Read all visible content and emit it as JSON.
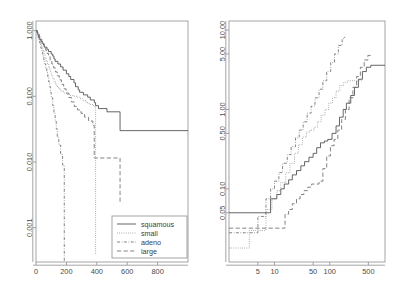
{
  "figure": {
    "title": "",
    "panel_count": 2
  },
  "legend": {
    "position": "bottom-right of left panel",
    "entries": [
      {
        "label": "squamous",
        "style": "solid",
        "color": "#4a4a4a"
      },
      {
        "label": "small",
        "style": "dotted",
        "color": "#6e6e6e"
      },
      {
        "label": "adeno",
        "style": "dashdot",
        "color": "#6e6e6e"
      },
      {
        "label": "large",
        "style": "dashed",
        "color": "#6e6e6e"
      }
    ]
  },
  "chart_data": [
    {
      "id": "left-panel",
      "type": "line",
      "title": "",
      "xlabel": "",
      "ylabel": "",
      "xscale": "linear",
      "yscale": "log",
      "xlim": [
        0,
        1000
      ],
      "ylim": [
        0.0003,
        1.4
      ],
      "grid": false,
      "legend_position": "lower right",
      "xticks": [
        0,
        200,
        400,
        600,
        800
      ],
      "xtick_labels": [
        "0",
        "200",
        "400",
        "600",
        "800"
      ],
      "yticks": [
        1.0,
        0.1,
        0.01,
        0.001
      ],
      "ytick_labels": [
        "1.000",
        "0.100",
        "0.010",
        "0.001"
      ],
      "series": [
        {
          "name": "squamous",
          "style": "solid",
          "x": [
            1,
            8,
            11,
            15,
            21,
            25,
            33,
            42,
            51,
            54,
            72,
            82,
            100,
            110,
            118,
            126,
            144,
            162,
            178,
            200,
            216,
            228,
            250,
            260,
            278,
            287,
            312,
            340,
            357,
            384,
            392,
            411,
            467,
            553,
            587,
            1000
          ],
          "y": [
            1.0,
            0.94,
            0.88,
            0.82,
            0.77,
            0.73,
            0.68,
            0.64,
            0.6,
            0.56,
            0.52,
            0.48,
            0.44,
            0.41,
            0.37,
            0.34,
            0.31,
            0.28,
            0.25,
            0.22,
            0.2,
            0.18,
            0.16,
            0.14,
            0.125,
            0.115,
            0.105,
            0.097,
            0.088,
            0.08,
            0.072,
            0.065,
            0.058,
            0.03,
            0.03,
            0.03
          ]
        },
        {
          "name": "small",
          "style": "dotted",
          "x": [
            1,
            7,
            13,
            18,
            24,
            29,
            35,
            40,
            47,
            53,
            59,
            67,
            75,
            84,
            92,
            100,
            110,
            119,
            130,
            141,
            156,
            170,
            185,
            200,
            220,
            245,
            270,
            290,
            310,
            330,
            350,
            378,
            392
          ],
          "y": [
            1.0,
            0.93,
            0.86,
            0.79,
            0.72,
            0.66,
            0.6,
            0.54,
            0.49,
            0.44,
            0.39,
            0.35,
            0.31,
            0.27,
            0.24,
            0.21,
            0.185,
            0.165,
            0.148,
            0.135,
            0.125,
            0.118,
            0.112,
            0.107,
            0.103,
            0.1,
            0.097,
            0.092,
            0.086,
            0.08,
            0.075,
            0.07,
            0.0004
          ]
        },
        {
          "name": "adeno",
          "style": "dashdot",
          "x": [
            1,
            6,
            10,
            15,
            20,
            26,
            32,
            38,
            44,
            51,
            58,
            64,
            71,
            78,
            84,
            90,
            95,
            100,
            110,
            118,
            126,
            133,
            140,
            150,
            162,
            175,
            186
          ],
          "y": [
            1.0,
            0.92,
            0.84,
            0.76,
            0.68,
            0.61,
            0.54,
            0.47,
            0.41,
            0.36,
            0.31,
            0.27,
            0.23,
            0.195,
            0.165,
            0.14,
            0.115,
            0.095,
            0.072,
            0.055,
            0.042,
            0.032,
            0.024,
            0.018,
            0.013,
            0.009,
            0.0002
          ]
        },
        {
          "name": "large",
          "style": "dashed",
          "x": [
            1,
            9,
            16,
            23,
            30,
            38,
            46,
            55,
            64,
            73,
            83,
            93,
            104,
            116,
            128,
            140,
            153,
            167,
            182,
            198,
            215,
            233,
            252,
            273,
            296,
            320,
            346,
            374,
            383,
            392,
            550,
            553
          ],
          "y": [
            1.0,
            0.93,
            0.87,
            0.8,
            0.74,
            0.68,
            0.62,
            0.56,
            0.5,
            0.45,
            0.4,
            0.35,
            0.31,
            0.27,
            0.235,
            0.205,
            0.178,
            0.152,
            0.13,
            0.112,
            0.096,
            0.082,
            0.07,
            0.062,
            0.055,
            0.048,
            0.042,
            0.036,
            0.0115,
            0.0115,
            0.0115,
            0.0023
          ]
        }
      ]
    },
    {
      "id": "right-panel",
      "type": "line",
      "title": "",
      "xlabel": "",
      "ylabel": "",
      "xscale": "log",
      "yscale": "log",
      "xlim": [
        1.5,
        1000
      ],
      "ylim": [
        0.012,
        13
      ],
      "grid": false,
      "legend_position": "none",
      "xticks": [
        5,
        10,
        50,
        100,
        500
      ],
      "xtick_labels": [
        "5",
        "10",
        "50",
        "100",
        "500"
      ],
      "yticks": [
        10.0,
        5.0,
        1.0,
        0.5,
        0.1,
        0.05
      ],
      "ytick_labels": [
        "10.00",
        "5.00",
        "1.00",
        "0.50",
        "0.10",
        "0.05"
      ],
      "series": [
        {
          "name": "squamous",
          "style": "solid",
          "x": [
            1.5,
            8,
            8.5,
            11,
            13,
            15,
            18,
            21,
            25,
            30,
            35,
            42,
            50,
            58,
            68,
            80,
            92,
            110,
            130,
            150,
            175,
            200,
            240,
            280,
            330,
            390,
            460,
            553,
            1000
          ],
          "y": [
            0.05,
            0.05,
            0.075,
            0.085,
            0.1,
            0.115,
            0.13,
            0.15,
            0.17,
            0.195,
            0.22,
            0.25,
            0.28,
            0.33,
            0.38,
            0.4,
            0.42,
            0.5,
            0.62,
            0.8,
            1.0,
            1.2,
            1.5,
            1.9,
            2.4,
            3.0,
            3.4,
            3.6,
            3.6
          ]
        },
        {
          "name": "small",
          "style": "dotted",
          "x": [
            1.5,
            3.2,
            3.5,
            6.5,
            7,
            9,
            11,
            13,
            16,
            19,
            23,
            27,
            32,
            38,
            44,
            52,
            60,
            70,
            82,
            96,
            112,
            130,
            152,
            178,
            208,
            243,
            284,
            332,
            392
          ],
          "y": [
            0.018,
            0.018,
            0.03,
            0.03,
            0.055,
            0.075,
            0.095,
            0.12,
            0.16,
            0.21,
            0.28,
            0.36,
            0.45,
            0.52,
            0.55,
            0.6,
            0.7,
            0.85,
            1.0,
            1.2,
            1.4,
            1.7,
            2.0,
            2.2,
            2.3,
            2.3,
            2.3,
            2.3,
            2.3
          ]
        },
        {
          "name": "adeno",
          "style": "dashdot",
          "x": [
            1.5,
            4.5,
            5,
            7,
            8.5,
            10,
            12,
            14,
            17,
            20,
            24,
            28,
            33,
            39,
            46,
            54,
            64,
            75,
            88,
            104,
            122,
            143,
            168,
            186
          ],
          "y": [
            0.028,
            0.028,
            0.045,
            0.075,
            0.1,
            0.125,
            0.16,
            0.21,
            0.27,
            0.34,
            0.44,
            0.55,
            0.7,
            0.9,
            1.1,
            1.4,
            1.8,
            2.3,
            3.0,
            3.9,
            5.0,
            6.4,
            7.8,
            8.2
          ]
        },
        {
          "name": "large",
          "style": "dashed",
          "x": [
            1.5,
            15,
            15.5,
            18,
            21,
            25,
            29,
            34,
            40,
            47,
            55,
            64,
            75,
            88,
            103,
            120,
            140,
            164,
            192,
            224,
            262,
            306,
            358,
            420,
            490,
            553
          ],
          "y": [
            0.032,
            0.032,
            0.048,
            0.055,
            0.065,
            0.075,
            0.085,
            0.095,
            0.105,
            0.115,
            0.115,
            0.125,
            0.18,
            0.26,
            0.35,
            0.42,
            0.55,
            0.75,
            1.0,
            1.4,
            1.9,
            2.6,
            3.4,
            4.2,
            4.8,
            5.0
          ]
        }
      ]
    }
  ]
}
